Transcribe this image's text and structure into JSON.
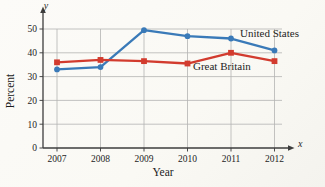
{
  "chart_data": {
    "type": "line",
    "title": "",
    "xlabel": "Year",
    "ylabel": "Percent",
    "x_axis_symbol": "x",
    "y_axis_symbol": "y",
    "categories": [
      "2007",
      "2008",
      "2009",
      "2010",
      "2011",
      "2012"
    ],
    "y_ticks": [
      "0",
      "10",
      "20",
      "30",
      "40",
      "50"
    ],
    "ylim": [
      0,
      50
    ],
    "grid": true,
    "legend_position": "inline-annotations",
    "series": [
      {
        "name": "United States",
        "color": "#3a7ab8",
        "marker": "circle",
        "values": [
          33,
          34,
          49.5,
          47,
          46,
          41
        ]
      },
      {
        "name": "Great Britain",
        "color": "#d23b2e",
        "marker": "square",
        "values": [
          36,
          37,
          36.5,
          35.5,
          40,
          36.5
        ]
      }
    ],
    "annotations": [
      {
        "text": "United States",
        "color": "#3a7ab8",
        "x": 240,
        "y": 37
      },
      {
        "text": "Great Britain",
        "color": "#cc3327",
        "x": 193,
        "y": 70
      }
    ]
  }
}
